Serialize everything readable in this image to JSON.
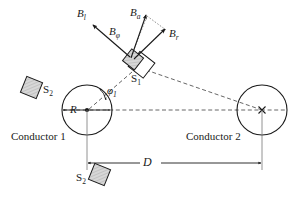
{
  "figure": {
    "type": "physics-diagram",
    "background_color": "#ffffff",
    "stroke_color": "#1a1a1a",
    "hatch_fill_color": "#c9c9c9"
  },
  "labels": {
    "b_total": "B",
    "b_total_sub": "l",
    "b_phi": "B",
    "b_phi_sub": "φ",
    "b_axial": "B",
    "b_axial_sub": "a",
    "b_radial": "B",
    "b_radial_sub": "r",
    "s1": "S",
    "s1_sub": "1",
    "s2_left": "S",
    "s2_left_sub": "2",
    "s2_bottom": "S",
    "s2_bottom_sub": "2",
    "radius": "R",
    "phi1": "φ",
    "phi1_sub": "1",
    "separation": "D",
    "conductor1": "Conductor 1",
    "conductor2": "Conductor 2"
  },
  "geometry": {
    "conductor1": {
      "center_x": 87,
      "center_y": 110,
      "radius": 25,
      "current_marker": "dot-out-of-page"
    },
    "conductor2": {
      "center_x": 262,
      "center_y": 110,
      "radius": 25,
      "current_marker": "cross-into-page"
    },
    "sensor_s1": {
      "x": 138,
      "y": 62,
      "rotation_deg": 38
    },
    "sensor_s2_left": {
      "x": 32,
      "y": 88,
      "rotation_deg": 22
    },
    "sensor_s2_bottom": {
      "x": 99,
      "y": 175,
      "rotation_deg": 22
    },
    "dimension_D": {
      "x_start": 87,
      "x_end": 262,
      "y": 163
    }
  },
  "vectors": [
    {
      "name": "B_l",
      "origin_x": 130,
      "origin_y": 57,
      "tip_x": 93,
      "tip_y": 25,
      "label_x": 77,
      "label_y": 9
    },
    {
      "name": "B_phi",
      "origin_x": 130,
      "origin_y": 57,
      "tip_x": 93,
      "tip_y": 25,
      "label_x": 109,
      "label_y": 27
    },
    {
      "name": "B_a",
      "origin_x": 131,
      "origin_y": 58,
      "tip_x": 146,
      "tip_y": 16,
      "label_x": 131,
      "label_y": 8
    },
    {
      "name": "B_r",
      "origin_x": 134,
      "origin_y": 59,
      "tip_x": 164,
      "tip_y": 30,
      "label_x": 170,
      "label_y": 29
    }
  ]
}
